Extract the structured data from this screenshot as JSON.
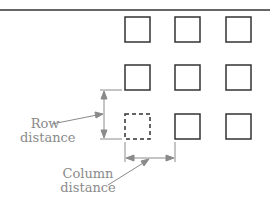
{
  "diagram": {
    "labels": {
      "row_distance_line1": "Row",
      "row_distance_line2": "distance",
      "column_distance_line1": "Column",
      "column_distance_line2": "distance"
    },
    "grid": {
      "rows": 3,
      "columns": 3,
      "dashed_cell": {
        "row": 3,
        "column": 1
      }
    },
    "colors": {
      "stroke": "#333333",
      "dimension": "#8a8a8a",
      "top_rule": "#333333"
    }
  }
}
